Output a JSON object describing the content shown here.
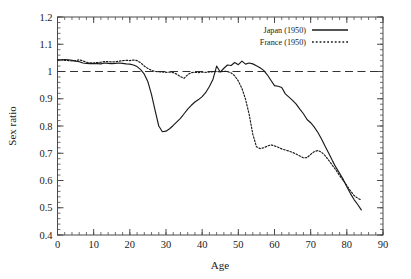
{
  "chart_data": {
    "type": "line",
    "title": "",
    "xlabel": "Age",
    "ylabel": "Sex ratio",
    "xlim": [
      0,
      90
    ],
    "ylim": [
      0.4,
      1.2
    ],
    "xticks": [
      0,
      10,
      20,
      30,
      40,
      50,
      60,
      70,
      80,
      90
    ],
    "xtick_labels": [
      "0",
      "10",
      "20",
      "30",
      "40",
      "50",
      "60",
      "70",
      "80",
      "90"
    ],
    "yticks": [
      0.4,
      0.5,
      0.6,
      0.7,
      0.8,
      0.9,
      1.0,
      1.1,
      1.2
    ],
    "ytick_labels": [
      "0.4",
      "0.5",
      "0.6",
      "0.7",
      "0.8",
      "0.9",
      "1",
      "1.1",
      "1.2"
    ],
    "x_minor_interval": 2,
    "y_minor_interval": 0.02,
    "grid": false,
    "legend_position": "top-right",
    "reference_line": {
      "axis": "y",
      "value": 1.0,
      "style": "dashed",
      "color": "#333333"
    },
    "series": [
      {
        "name": "Japan (1950)",
        "style": "solid",
        "color": "#1a1a1a",
        "x": [
          0,
          1,
          2,
          3,
          4,
          5,
          6,
          7,
          8,
          9,
          10,
          11,
          12,
          13,
          14,
          15,
          16,
          17,
          18,
          19,
          20,
          21,
          22,
          23,
          24,
          25,
          26,
          27,
          28,
          29,
          30,
          31,
          32,
          33,
          34,
          35,
          36,
          37,
          38,
          39,
          40,
          41,
          42,
          43,
          44,
          45,
          46,
          47,
          48,
          49,
          50,
          51,
          52,
          53,
          54,
          55,
          56,
          57,
          58,
          59,
          60,
          61,
          62,
          63,
          64,
          65,
          66,
          67,
          68,
          69,
          70,
          71,
          72,
          73,
          74,
          75,
          76,
          77,
          78,
          79,
          80,
          81,
          82,
          83,
          84
        ],
        "y": [
          1.042,
          1.043,
          1.044,
          1.043,
          1.041,
          1.038,
          1.036,
          1.031,
          1.03,
          1.029,
          1.03,
          1.029,
          1.028,
          1.031,
          1.03,
          1.029,
          1.03,
          1.031,
          1.03,
          1.028,
          1.027,
          1.024,
          1.018,
          1.007,
          0.99,
          0.962,
          0.915,
          0.856,
          0.8,
          0.779,
          0.781,
          0.79,
          0.802,
          0.815,
          0.828,
          0.845,
          0.862,
          0.876,
          0.888,
          0.897,
          0.908,
          0.923,
          0.945,
          0.972,
          1.02,
          0.998,
          1.012,
          1.024,
          1.022,
          1.033,
          1.025,
          1.038,
          1.027,
          1.031,
          1.028,
          1.021,
          1.014,
          1.004,
          0.988,
          0.968,
          0.948,
          0.946,
          0.941,
          0.918,
          0.906,
          0.894,
          0.88,
          0.862,
          0.845,
          0.824,
          0.812,
          0.796,
          0.776,
          0.752,
          0.726,
          0.7,
          0.673,
          0.648,
          0.626,
          0.604,
          0.577,
          0.552,
          0.53,
          0.512,
          0.492
        ]
      },
      {
        "name": "France (1950)",
        "style": "dotted",
        "color": "#1a1a1a",
        "x": [
          0,
          1,
          2,
          3,
          4,
          5,
          6,
          7,
          8,
          9,
          10,
          11,
          12,
          13,
          14,
          15,
          16,
          17,
          18,
          19,
          20,
          21,
          22,
          23,
          24,
          25,
          26,
          27,
          28,
          29,
          30,
          31,
          32,
          33,
          34,
          35,
          36,
          37,
          38,
          39,
          40,
          41,
          42,
          43,
          44,
          45,
          46,
          47,
          48,
          49,
          50,
          51,
          52,
          53,
          54,
          55,
          56,
          57,
          58,
          59,
          60,
          61,
          62,
          63,
          64,
          65,
          66,
          67,
          68,
          69,
          70,
          71,
          72,
          73,
          74,
          75,
          76,
          77,
          78,
          79,
          80,
          81,
          82,
          83,
          84
        ],
        "y": [
          1.043,
          1.042,
          1.041,
          1.04,
          1.039,
          1.04,
          1.043,
          1.039,
          1.034,
          1.032,
          1.031,
          1.033,
          1.034,
          1.036,
          1.036,
          1.035,
          1.036,
          1.038,
          1.04,
          1.041,
          1.04,
          1.042,
          1.04,
          1.032,
          1.02,
          1.011,
          1.004,
          1.0,
          0.999,
          0.998,
          0.997,
          0.998,
          0.996,
          0.99,
          0.981,
          0.975,
          0.988,
          0.996,
          0.997,
          0.996,
          0.998,
          0.997,
          0.998,
          0.999,
          1.0,
          0.999,
          1.001,
          1.0,
          0.995,
          0.984,
          0.965,
          0.938,
          0.898,
          0.842,
          0.77,
          0.724,
          0.717,
          0.72,
          0.726,
          0.731,
          0.727,
          0.722,
          0.716,
          0.712,
          0.708,
          0.703,
          0.697,
          0.69,
          0.683,
          0.684,
          0.696,
          0.706,
          0.71,
          0.704,
          0.691,
          0.674,
          0.656,
          0.638,
          0.618,
          0.6,
          0.582,
          0.562,
          0.545,
          0.535,
          0.528
        ]
      }
    ]
  },
  "legend": {
    "entries": [
      {
        "label": "Japan (1950)",
        "style": "solid"
      },
      {
        "label": "France (1950)",
        "style": "dotted"
      }
    ]
  }
}
